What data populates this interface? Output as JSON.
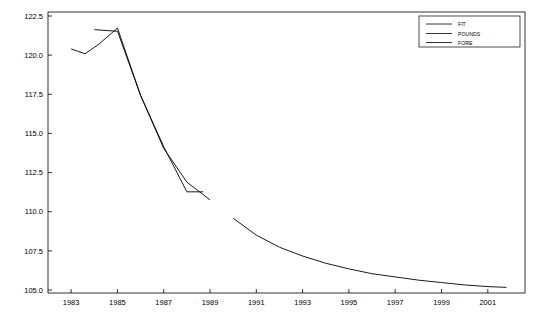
{
  "chart_data": {
    "type": "line",
    "title": "",
    "xlabel": "",
    "ylabel": "",
    "xlim": [
      1982.0,
      2002.6
    ],
    "ylim": [
      105.0,
      122.5
    ],
    "grid": false,
    "legend_position": "top-right",
    "ytick_labels": [
      "122.5",
      "120.0",
      "117.5",
      "115.0",
      "112.5",
      "110.0",
      "107.5",
      "105.0"
    ],
    "ytick_values": [
      122.5,
      120.0,
      117.5,
      115.0,
      112.5,
      110.0,
      107.5,
      105.0
    ],
    "xtick_labels": [
      "1983",
      "1985",
      "1987",
      "1989",
      "1991",
      "1993",
      "1995",
      "1997",
      "1999",
      "2001"
    ],
    "xtick_values": [
      1983,
      1985,
      1987,
      1989,
      1991,
      1993,
      1995,
      1997,
      1999,
      2001
    ],
    "series": [
      {
        "name": "FIT",
        "color": "#000000",
        "x": [
          1984.0,
          1985.0,
          1986.0,
          1987.0,
          1988.0,
          1989.0
        ],
        "values": [
          121.4,
          121.3,
          117.3,
          114.0,
          111.9,
          110.8
        ]
      },
      {
        "name": "POUNDS",
        "color": "#000000",
        "x": [
          1983.0,
          1983.6,
          1984.2,
          1985.0,
          1986.0,
          1987.0,
          1988.0,
          1988.7
        ],
        "values": [
          120.2,
          119.9,
          120.5,
          121.5,
          117.3,
          114.1,
          111.3,
          111.3
        ]
      },
      {
        "name": "FORE",
        "color": "#000000",
        "x": [
          1990.0,
          1991.0,
          1992.0,
          1993.0,
          1994.0,
          1995.0,
          1996.0,
          1997.0,
          1998.0,
          1999.0,
          2000.0,
          2001.0,
          2001.8
        ],
        "values": [
          109.65,
          108.6,
          107.85,
          107.3,
          106.85,
          106.5,
          106.2,
          106.0,
          105.8,
          105.65,
          105.5,
          105.4,
          105.35
        ]
      }
    ],
    "legend": {
      "entries": [
        {
          "label": "FIT",
          "color": "#000000"
        },
        {
          "label": "POUNDS",
          "color": "#000000"
        },
        {
          "label": "FORE",
          "color": "#000000"
        }
      ]
    }
  }
}
